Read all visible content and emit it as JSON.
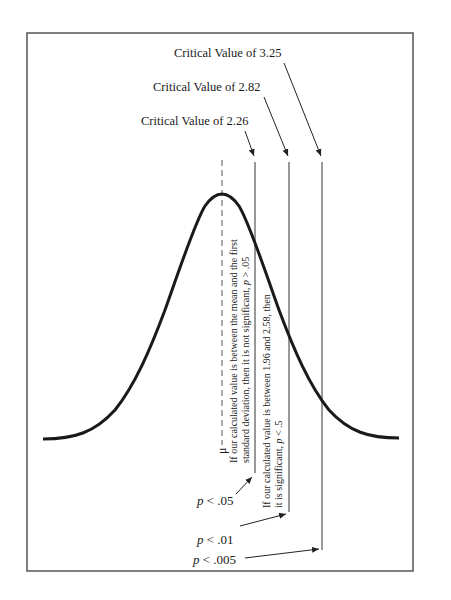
{
  "figure": {
    "frame_color": "#555555",
    "curve_color": "#1a1a1a",
    "line_color": "#333333",
    "critical_values": [
      {
        "label": "Critical Value of 3.25",
        "line_x": 322
      },
      {
        "label": "Critical Value of 2.82",
        "line_x": 289
      },
      {
        "label": "Critical Value of 2.26",
        "line_x": 255
      }
    ],
    "mean_symbol": "μ",
    "annotations": {
      "not_significant": {
        "line1": "If our calculated value is between the mean and the first",
        "line2_prefix": "standard deviation, then it is not significant, ",
        "line2_p": "p",
        "line2_suffix": " > .05"
      },
      "significant": {
        "line1": "If our calculated value is between 1.96 and 2.58, then",
        "line2_prefix": "it is significant, ",
        "line2_p": "p",
        "line2_suffix": " < .5"
      }
    },
    "p_labels": [
      {
        "p": "p",
        "rest": " < .05"
      },
      {
        "p": "p",
        "rest": " < .01"
      },
      {
        "p": "p",
        "rest": " < .005"
      }
    ]
  }
}
